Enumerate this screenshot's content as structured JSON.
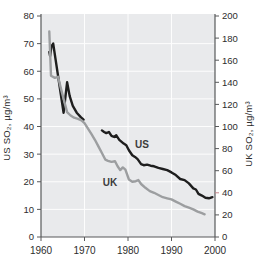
{
  "chart_data": {
    "type": "line",
    "title": "",
    "x": {
      "label": "",
      "min": 1960,
      "max": 2000,
      "ticks": [
        1960,
        1970,
        1980,
        1990,
        2000
      ],
      "gridlines": [
        1970,
        1980,
        1990
      ]
    },
    "y_left": {
      "label": "US SO₂, µg/m³",
      "min": 0,
      "max": 80,
      "ticks": [
        0,
        10,
        20,
        30,
        40,
        50,
        60,
        70,
        80
      ],
      "gridlines": [
        10,
        20,
        30,
        40,
        50,
        60,
        70
      ]
    },
    "y_right": {
      "label": "UK SO₂, µg/m³",
      "min": 0,
      "max": 200,
      "ticks": [
        0,
        20,
        40,
        60,
        80,
        100,
        120,
        140,
        160,
        180,
        200
      ],
      "highlight_tick": {
        "value": 40,
        "color": "#c5878b"
      }
    },
    "colors": {
      "plot_bg": "#e9eaec",
      "grid": "#fdfdfd",
      "axis": "#58595b",
      "us_line": "#1e1e1e",
      "uk_line": "#9c9ea0"
    },
    "legend_position": "inline-labels",
    "series": [
      {
        "name": "US",
        "axis": "left",
        "color": "#1e1e1e",
        "width": 2.4,
        "label": {
          "text": "US"
        },
        "segments": [
          [
            [
              1961.9,
              67
            ],
            [
              1962.1,
              65.5
            ],
            [
              1962.4,
              69
            ],
            [
              1962.8,
              70
            ],
            [
              1965.2,
              45
            ],
            [
              1966.0,
              56
            ],
            [
              1966.6,
              51
            ],
            [
              1967.3,
              47.5
            ],
            [
              1968.2,
              45
            ],
            [
              1969.2,
              43.3
            ],
            [
              1969.8,
              42.5
            ]
          ],
          [
            [
              1974.0,
              38.6
            ],
            [
              1974.5,
              38.0
            ],
            [
              1975.0,
              37.6
            ],
            [
              1975.6,
              38.0
            ],
            [
              1976.2,
              36.6
            ],
            [
              1976.8,
              36.2
            ],
            [
              1977.3,
              36.8
            ],
            [
              1978.0,
              35.2
            ],
            [
              1979.0,
              33.8
            ],
            [
              1979.6,
              33.2
            ],
            [
              1980.2,
              31.4
            ],
            [
              1981.0,
              29.6
            ],
            [
              1981.6,
              29.0
            ],
            [
              1982.2,
              28.2
            ],
            [
              1983.0,
              26.4
            ],
            [
              1983.6,
              26.0
            ],
            [
              1984.4,
              26.2
            ],
            [
              1985.2,
              25.8
            ],
            [
              1986.0,
              25.6
            ],
            [
              1987.0,
              25.0
            ],
            [
              1988.0,
              24.6
            ],
            [
              1989.0,
              24.2
            ],
            [
              1990.0,
              23.4
            ],
            [
              1991.0,
              22.4
            ],
            [
              1992.0,
              21.0
            ],
            [
              1993.0,
              20.6
            ],
            [
              1994.0,
              19.4
            ],
            [
              1995.0,
              17.6
            ],
            [
              1995.6,
              17.2
            ],
            [
              1996.2,
              15.6
            ],
            [
              1997.0,
              15.0
            ],
            [
              1997.8,
              14.2
            ],
            [
              1998.6,
              14.0
            ],
            [
              1999.4,
              14.4
            ]
          ]
        ]
      },
      {
        "name": "UK",
        "axis": "right",
        "color": "#9c9ea0",
        "width": 2.4,
        "label": {
          "text": "UK"
        },
        "segments": [
          [
            [
              1961.9,
              186
            ],
            [
              1962.3,
              146
            ],
            [
              1963.2,
              144
            ],
            [
              1963.9,
              145
            ],
            [
              1964.6,
              134
            ],
            [
              1965.4,
              122
            ],
            [
              1966.0,
              113
            ],
            [
              1966.8,
              110
            ],
            [
              1967.6,
              108
            ],
            [
              1968.5,
              107
            ],
            [
              1969.3,
              105.5
            ],
            [
              1970.0,
              103
            ],
            [
              1970.8,
              98
            ],
            [
              1971.6,
              93
            ],
            [
              1972.4,
              88
            ],
            [
              1973.2,
              82
            ],
            [
              1974.0,
              76
            ],
            [
              1974.8,
              70
            ],
            [
              1975.4,
              69
            ],
            [
              1976.2,
              68
            ],
            [
              1977.0,
              68.5
            ],
            [
              1977.6,
              64
            ],
            [
              1978.2,
              60.5
            ],
            [
              1978.8,
              63
            ],
            [
              1979.4,
              61
            ],
            [
              1980.2,
              52
            ],
            [
              1981.0,
              50
            ],
            [
              1981.8,
              50.5
            ],
            [
              1982.4,
              51.5
            ],
            [
              1983.0,
              48
            ],
            [
              1984.0,
              44.5
            ],
            [
              1985.0,
              41.5
            ],
            [
              1986.0,
              40
            ],
            [
              1987.0,
              38
            ],
            [
              1988.0,
              36
            ],
            [
              1989.0,
              35
            ],
            [
              1990.0,
              34
            ],
            [
              1991.0,
              32
            ],
            [
              1992.0,
              30
            ],
            [
              1993.0,
              28
            ],
            [
              1994.0,
              26.5
            ],
            [
              1995.0,
              25
            ],
            [
              1996.0,
              23
            ],
            [
              1997.0,
              21.5
            ],
            [
              1997.6,
              20.5
            ]
          ]
        ]
      }
    ]
  }
}
